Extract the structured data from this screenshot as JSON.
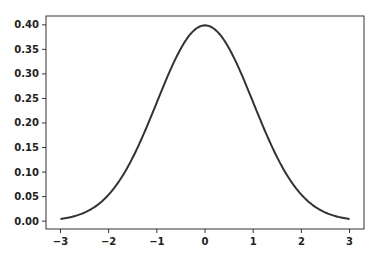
{
  "chart_data": {
    "type": "line",
    "title": "",
    "xlabel": "",
    "ylabel": "",
    "xlim": [
      -3.3,
      3.3
    ],
    "ylim": [
      -0.016,
      0.418
    ],
    "grid": false,
    "legend": null,
    "x_ticks": [
      -3,
      -2,
      -1,
      0,
      1,
      2,
      3
    ],
    "x_tick_labels": [
      "−3",
      "−2",
      "−1",
      "0",
      "1",
      "2",
      "3"
    ],
    "y_ticks": [
      0.0,
      0.05,
      0.1,
      0.15,
      0.2,
      0.25,
      0.3,
      0.35,
      0.4
    ],
    "y_tick_labels": [
      "0.00",
      "0.05",
      "0.10",
      "0.15",
      "0.20",
      "0.25",
      "0.30",
      "0.35",
      "0.40"
    ],
    "series": [
      {
        "name": "standard normal pdf",
        "color": "#333333",
        "x": [
          -3.0,
          -2.75,
          -2.5,
          -2.25,
          -2.0,
          -1.75,
          -1.5,
          -1.25,
          -1.0,
          -0.75,
          -0.5,
          -0.25,
          0.0,
          0.25,
          0.5,
          0.75,
          1.0,
          1.25,
          1.5,
          1.75,
          2.0,
          2.25,
          2.5,
          2.75,
          3.0
        ],
        "y": [
          0.0044,
          0.0091,
          0.0175,
          0.0317,
          0.054,
          0.0863,
          0.1295,
          0.1826,
          0.242,
          0.3011,
          0.3521,
          0.3867,
          0.3989,
          0.3867,
          0.3521,
          0.3011,
          0.242,
          0.1826,
          0.1295,
          0.0863,
          0.054,
          0.0317,
          0.0175,
          0.0091,
          0.0044
        ]
      }
    ]
  },
  "plot_area": {
    "left": 46,
    "top": 16,
    "right": 364,
    "bottom": 229
  }
}
